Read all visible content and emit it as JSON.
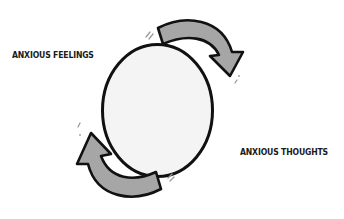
{
  "diagram": {
    "type": "cycle",
    "center_node": {
      "shape": "circle",
      "fill": "#f4f4f4",
      "stroke": "#111111"
    },
    "labels": {
      "feelings": "ANXIOUS FEELINGS",
      "thoughts": "ANXIOUS THOUGHTS"
    },
    "arrows": [
      {
        "name": "top-arrow",
        "direction": "clockwise",
        "from": "top",
        "to": "right",
        "fill": "#a6a6a6"
      },
      {
        "name": "bottom-arrow",
        "direction": "clockwise",
        "from": "bottom",
        "to": "left",
        "fill": "#a6a6a6"
      }
    ],
    "colors": {
      "background": "#ffffff",
      "outline": "#111111",
      "arrow_fill": "#a6a6a6",
      "circle_fill": "#f4f4f4",
      "text": "#1a1a1a"
    }
  }
}
